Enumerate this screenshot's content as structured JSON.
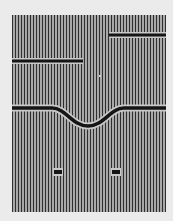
{
  "figure": {
    "type": "striped-illusion-pattern",
    "stripe_colors": {
      "dark": "#2e2e2e",
      "light": "#a8a8a8"
    },
    "background_color": "#ebebeb",
    "bar_color": "#151515",
    "bar_halo_color": "#c8c8c8",
    "elements": [
      {
        "name": "bar-top-right",
        "shape": "horizontal-line",
        "x1": 109,
        "x2": 166,
        "y": 35
      },
      {
        "name": "bar-mid-left",
        "shape": "horizontal-line",
        "x1": 12,
        "x2": 83,
        "y": 61
      },
      {
        "name": "center-mark",
        "shape": "dot",
        "x": 100,
        "y": 76
      },
      {
        "name": "curved-bar",
        "shape": "dip-curve",
        "y_flat": 108,
        "y_dip": 126
      },
      {
        "name": "dot-left",
        "shape": "dot",
        "x": 58,
        "y": 172
      },
      {
        "name": "dot-right",
        "shape": "dot",
        "x": 116,
        "y": 172
      }
    ]
  }
}
